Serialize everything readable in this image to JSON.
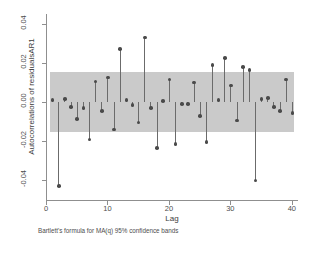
{
  "chart_data": {
    "type": "bar",
    "title": "",
    "subtitle": "",
    "xlabel": "Lag",
    "ylabel": "Autocorrelations of residualsAR1",
    "note": "Bartlett's formula for MA(q) 95% confidence bands",
    "grid": false,
    "legend": "none",
    "xlim": [
      0,
      41
    ],
    "ylim": [
      -0.05,
      0.045
    ],
    "xticks": [
      "0",
      "10",
      "20",
      "30",
      "40"
    ],
    "xtick_values": [
      0,
      10,
      20,
      30,
      40
    ],
    "yticks": [
      "0.04",
      "0.02",
      "0.00",
      "-0.02",
      "-0.04"
    ],
    "ytick_values": [
      0.04,
      0.02,
      0.0,
      -0.02,
      -0.04
    ],
    "confidence_band": {
      "label": "Bartlett's formula for MA(q) 95% confidence bands",
      "upper": 0.0155,
      "lower": -0.0155,
      "color": "#c6c6c6"
    },
    "marker_color": "#4a4a4a",
    "stem_color": "#6b6b6b",
    "categories": [
      1,
      2,
      3,
      4,
      5,
      6,
      7,
      8,
      9,
      10,
      11,
      12,
      13,
      14,
      15,
      16,
      17,
      18,
      19,
      20,
      21,
      22,
      23,
      24,
      25,
      26,
      27,
      28,
      29,
      30,
      31,
      32,
      33,
      34,
      35,
      36,
      37,
      38,
      39,
      40
    ],
    "values": [
      0.001,
      -0.043,
      0.0015,
      -0.0025,
      -0.0085,
      -0.003,
      -0.019,
      0.0105,
      -0.0045,
      0.0125,
      -0.014,
      0.027,
      0.001,
      -0.0015,
      -0.0105,
      0.033,
      -0.003,
      -0.0235,
      0.0005,
      0.0115,
      -0.0215,
      -0.001,
      -0.001,
      0.01,
      -0.007,
      -0.0205,
      0.019,
      0.001,
      0.0225,
      0.0085,
      -0.0095,
      0.018,
      0.0165,
      -0.04,
      0.0015,
      0.002,
      -0.0025,
      -0.0045,
      0.0115,
      -0.0055
    ]
  }
}
